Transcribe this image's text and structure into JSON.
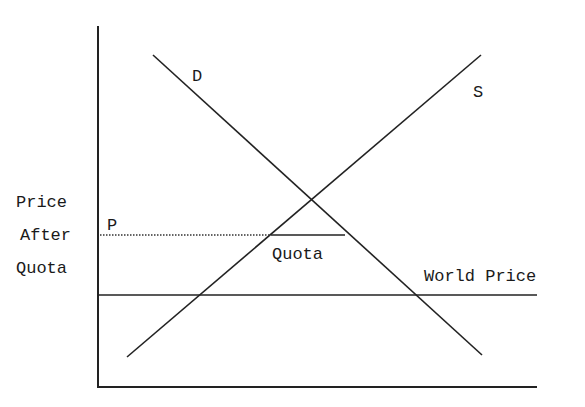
{
  "diagram": {
    "type": "supply-demand-import-quota",
    "labels": {
      "demand": "D",
      "supply": "S",
      "price_after_quota_line1": "Price",
      "price_after_quota_line2": "After",
      "price_after_quota_line3": "Quota",
      "price_marker": "P",
      "quota": "Quota",
      "world_price": "World Price"
    },
    "colors": {
      "line": "#222222",
      "background": "#ffffff"
    },
    "geometry": {
      "y_axis": {
        "x": 98,
        "y1": 26,
        "y2": 387
      },
      "x_axis": {
        "y": 387,
        "x1": 98,
        "x2": 537
      },
      "demand": {
        "x1": 153,
        "y1": 55,
        "x2": 482,
        "y2": 355
      },
      "supply": {
        "x1": 127,
        "y1": 357,
        "x2": 481,
        "y2": 55
      },
      "world_price": {
        "y": 295,
        "x1": 98,
        "x2": 537
      },
      "price_after_quota_dotted": {
        "y": 235,
        "x1": 100,
        "x2": 271
      },
      "quota_segment": {
        "y": 235,
        "x1": 271,
        "x2": 345
      }
    }
  }
}
